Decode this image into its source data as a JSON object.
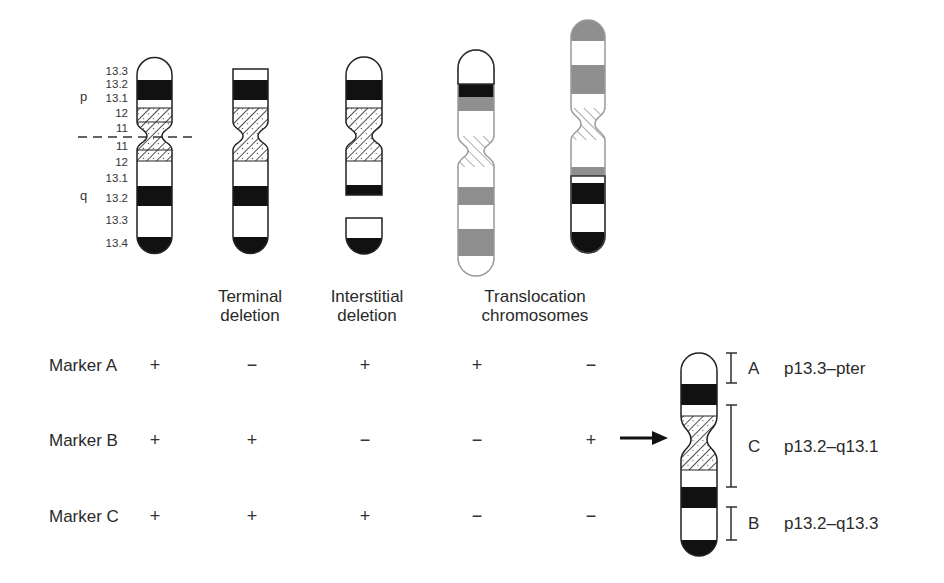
{
  "figure": {
    "arm_labels": {
      "p": "p",
      "q": "q"
    },
    "band_labels": [
      "13.3",
      "13.2",
      "13.1",
      "12",
      "11",
      "11",
      "12",
      "13.1",
      "13.2",
      "13.3",
      "13.4"
    ],
    "chromosome_captions": [
      {
        "line1": "Terminal",
        "line2": "deletion"
      },
      {
        "line1": "Interstitial",
        "line2": "deletion"
      },
      {
        "line1": "Translocation",
        "line2": "chromosomes"
      }
    ],
    "markers": [
      {
        "name": "Marker A",
        "results": [
          "+",
          "−",
          "+",
          "+",
          "−"
        ]
      },
      {
        "name": "Marker B",
        "results": [
          "+",
          "+",
          "−",
          "−",
          "+"
        ]
      },
      {
        "name": "Marker C",
        "results": [
          "+",
          "+",
          "+",
          "−",
          "−"
        ]
      }
    ],
    "map": {
      "regions": [
        {
          "letter": "A",
          "range": "p13.3–pter"
        },
        {
          "letter": "C",
          "range": "p13.2–q13.1"
        },
        {
          "letter": "B",
          "range": "p13.2–q13.3"
        }
      ]
    },
    "colors": {
      "black": "#111111",
      "grey": "#8f8f8f",
      "outline": "#222222"
    }
  }
}
